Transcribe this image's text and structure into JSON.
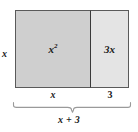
{
  "diagram": {
    "type": "area-model",
    "height_label": "x",
    "total_width_label": "x + 3",
    "cells": [
      {
        "name": "x-squared-cell",
        "area_label": "x",
        "area_exponent": "2",
        "width_label": "x",
        "fill": "#cfcfcf"
      },
      {
        "name": "three-x-cell",
        "area_label": "3x",
        "width_label": "3",
        "fill": "#e4e4e4"
      }
    ],
    "colors": {
      "left_fill": "#cfcfcf",
      "right_fill": "#e4e4e4",
      "outline": "#5a5a5a",
      "divider": "#3a3a3a",
      "brace": "#8c8c8c",
      "text": "#1a1a1a",
      "background": "#ffffff"
    }
  }
}
